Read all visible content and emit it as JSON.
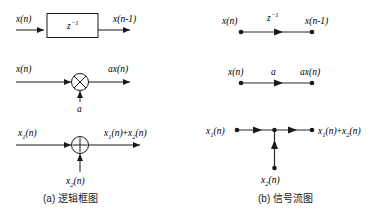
{
  "figure": {
    "background_color": "#ffffff",
    "line_color": "#1a1a1a",
    "text_color": "#000000",
    "captions": [
      {
        "id": "caption-a",
        "text": "(a) 逻辑框图"
      },
      {
        "id": "caption-b",
        "text": "(b) 信号流图"
      }
    ],
    "panels": {
      "a": {
        "name": "logic-block-diagram",
        "rows": [
          {
            "id": "delay",
            "name": "unit-delay",
            "input_label_base": "x",
            "input_label": "x(n)",
            "block_symbol_base": "z",
            "block_symbol_exp": "-1",
            "output_label": "x(n-1)",
            "output_label_arg": "(n",
            "output_label_minus": "−",
            "output_label_tail": "1)"
          },
          {
            "id": "multiplier",
            "name": "constant-multiplier",
            "input_label": "x(n)",
            "gain_label": "a",
            "output_label_coef": "a",
            "output_label": "ax(n)",
            "operator_symbol": "multiply"
          },
          {
            "id": "adder",
            "name": "adder",
            "input1_label_base": "x",
            "input1_sub": "1",
            "input1_label": "x1(n)",
            "input2_label_base": "x",
            "input2_sub": "2",
            "input2_label": "x2(n)",
            "output_label": "x1(n)+x2(n)",
            "operator_symbol": "plus",
            "plus_sign": "+"
          }
        ]
      },
      "b": {
        "name": "signal-flow-graph",
        "rows": [
          {
            "id": "delay",
            "name": "unit-delay-branch",
            "source_label": "x(n)",
            "branch_gain_base": "z",
            "branch_gain_exp": "-1",
            "sink_label": "x(n-1)"
          },
          {
            "id": "multiplier",
            "name": "gain-branch",
            "source_label": "x(n)",
            "branch_gain": "a",
            "sink_label": "ax(n)"
          },
          {
            "id": "adder",
            "name": "summing-node",
            "source1_label": "x1(n)",
            "source2_label": "x2(n)",
            "sink_label": "x1(n)+x2(n)"
          }
        ]
      }
    },
    "symbols": {
      "x_base": "x",
      "n_arg_open": "(",
      "n_arg": "n",
      "n_arg_close": ")",
      "sub_1": "1",
      "sub_2": "2",
      "plus": "+",
      "minus": "−",
      "a_gain": "a",
      "z_base": "z",
      "exp_minus1": "−1"
    }
  }
}
